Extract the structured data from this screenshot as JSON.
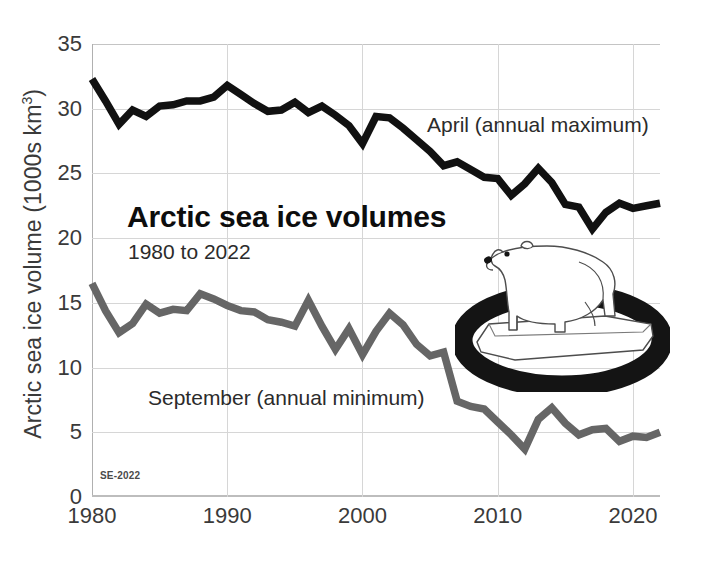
{
  "chart_data": {
    "type": "line",
    "title": "Arctic sea ice volumes",
    "subtitle": "1980 to 2022",
    "xlabel": "",
    "ylabel": "Arctic sea ice volume (1000s km3)",
    "ylabel_prefix": "Arctic sea ice volume (1000s km",
    "ylabel_sup": "3",
    "ylabel_suffix": ")",
    "xlim": [
      1980,
      2022
    ],
    "ylim": [
      0,
      35
    ],
    "yticks": [
      0,
      5,
      10,
      15,
      20,
      25,
      30,
      35
    ],
    "ytick_labels": [
      "0",
      "5",
      "10",
      "15",
      "20",
      "25",
      "30",
      "35"
    ],
    "xticks": [
      1980,
      1990,
      2000,
      2010,
      2020
    ],
    "xtick_labels": [
      "1980",
      "1990",
      "2000",
      "2010",
      "2020"
    ],
    "grid": true,
    "legend_position": "inline-annotation",
    "x": [
      1980,
      1981,
      1982,
      1983,
      1984,
      1985,
      1986,
      1987,
      1988,
      1989,
      1990,
      1991,
      1992,
      1993,
      1994,
      1995,
      1996,
      1997,
      1998,
      1999,
      2000,
      2001,
      2002,
      2003,
      2004,
      2005,
      2006,
      2007,
      2008,
      2009,
      2010,
      2011,
      2012,
      2013,
      2014,
      2015,
      2016,
      2017,
      2018,
      2019,
      2020,
      2021,
      2022
    ],
    "series": [
      {
        "name": "April (annual maximum)",
        "label": "April (annual maximum)",
        "color": "#111111",
        "values": [
          32.3,
          30.6,
          28.8,
          29.9,
          29.4,
          30.2,
          30.3,
          30.6,
          30.6,
          30.9,
          31.8,
          31.1,
          30.4,
          29.8,
          29.9,
          30.5,
          29.7,
          30.2,
          29.5,
          28.7,
          27.3,
          29.4,
          29.3,
          28.5,
          27.6,
          26.7,
          25.6,
          25.9,
          25.3,
          24.7,
          24.6,
          23.3,
          24.2,
          25.4,
          24.3,
          22.6,
          22.4,
          20.7,
          22.0,
          22.7,
          22.3,
          22.5,
          22.7
        ]
      },
      {
        "name": "September (annual minimum)",
        "label": "September (annual minimum)",
        "color": "#666666",
        "values": [
          16.5,
          14.4,
          12.7,
          13.4,
          14.9,
          14.2,
          14.5,
          14.4,
          15.7,
          15.3,
          14.8,
          14.4,
          14.3,
          13.7,
          13.5,
          13.2,
          15.2,
          13.2,
          11.4,
          13.0,
          11.0,
          12.8,
          14.2,
          13.3,
          11.8,
          10.9,
          11.2,
          7.4,
          7.0,
          6.8,
          5.8,
          4.8,
          3.7,
          6.0,
          6.9,
          5.7,
          4.8,
          5.2,
          5.3,
          4.3,
          4.7,
          4.6,
          5.0
        ]
      }
    ],
    "annotations": [
      {
        "name": "chart-title",
        "text": "Arctic sea ice volumes"
      },
      {
        "name": "chart-subtitle",
        "text": "1980 to 2022"
      },
      {
        "name": "april-series-label",
        "text": "April (annual maximum)"
      },
      {
        "name": "september-series-label",
        "text": "September (annual minimum)"
      },
      {
        "name": "source-watermark",
        "text": "SE-2022"
      }
    ],
    "illustration": "polar-bear-on-ice-floe"
  },
  "labels": {
    "title": "Arctic sea ice volumes",
    "subtitle": "1980 to 2022",
    "april": "April (annual maximum)",
    "september": "September (annual minimum)",
    "watermark": "SE-2022",
    "ylabel_prefix": "Arctic sea ice volume (1000s km",
    "ylabel_sup": "3",
    "ylabel_suffix": ")"
  },
  "colors": {
    "april_line": "#111111",
    "september_line": "#666666",
    "grid": "#d6d6d6",
    "axis": "#b0b0b0",
    "text": "#3a3a3a",
    "ice": "#ffffff",
    "water": "#141414"
  }
}
